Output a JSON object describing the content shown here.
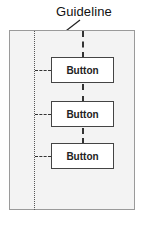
{
  "diagram": {
    "annotation_label": "Guideline",
    "buttons": [
      {
        "label": "Button"
      },
      {
        "label": "Button"
      },
      {
        "label": "Button"
      }
    ],
    "colors": {
      "panel_bg": "#f3f3f3",
      "panel_border": "#9a9a9a",
      "button_bg": "#ffffff",
      "line": "#333333"
    }
  }
}
